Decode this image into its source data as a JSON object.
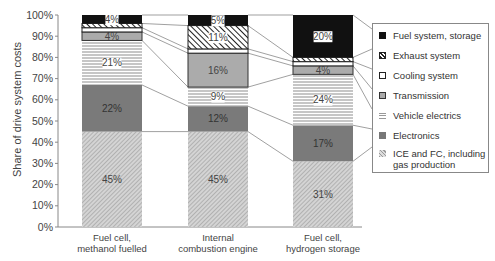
{
  "chart_data": {
    "type": "bar",
    "stacked": true,
    "title": "",
    "xlabel": "",
    "ylabel": "Share of drive system costs",
    "ylim": [
      0,
      100
    ],
    "yticks": [
      "0%",
      "10%",
      "20%",
      "30%",
      "40%",
      "50%",
      "60%",
      "70%",
      "80%",
      "90%",
      "100%"
    ],
    "categories": [
      "Fuel cell, methanol fuelled",
      "Internal combustion engine",
      "Fuel cell, hydrogen storage"
    ],
    "series": [
      {
        "name": "ICE and FC, including gas production",
        "values": [
          45,
          45,
          31
        ],
        "labels": [
          "45%",
          "45%",
          "31%"
        ]
      },
      {
        "name": "Electronics",
        "values": [
          22,
          12,
          17
        ],
        "labels": [
          "22%",
          "12%",
          "17%"
        ]
      },
      {
        "name": "Vehicle electrics",
        "values": [
          21,
          9,
          24
        ],
        "labels": [
          "21%",
          "9%",
          "24%"
        ]
      },
      {
        "name": "Transmission",
        "values": [
          4,
          16,
          4
        ],
        "labels": [
          "4%",
          "16%",
          "4%"
        ]
      },
      {
        "name": "Cooling system",
        "values": [
          2,
          2,
          2
        ],
        "labels": [
          "",
          "",
          ""
        ]
      },
      {
        "name": "Exhaust system",
        "values": [
          2,
          11,
          2
        ],
        "labels": [
          "",
          "11%",
          ""
        ]
      },
      {
        "name": "Fuel system, storage",
        "values": [
          4,
          5,
          20
        ],
        "labels": [
          "4%",
          "5%",
          "20%"
        ]
      }
    ],
    "legend_position": "right",
    "grid": false
  },
  "axis": {
    "ylabel": "Share of drive system costs",
    "yticks": [
      "0%",
      "10%",
      "20%",
      "30%",
      "40%",
      "50%",
      "60%",
      "70%",
      "80%",
      "90%",
      "100%"
    ],
    "categories": [
      {
        "line1": "Fuel cell,",
        "line2": "methanol fuelled"
      },
      {
        "line1": "Internal",
        "line2": "combustion engine"
      },
      {
        "line1": "Fuel cell,",
        "line2": "hydrogen storage"
      }
    ]
  },
  "legend": {
    "items": [
      {
        "label": "Fuel system, storage"
      },
      {
        "label": "Exhaust system"
      },
      {
        "label": "Cooling system"
      },
      {
        "label": "Transmission"
      },
      {
        "label": "Vehicle electrics"
      },
      {
        "label": "Electronics"
      },
      {
        "label": "ICE and FC, including",
        "label2": "gas production"
      }
    ]
  }
}
